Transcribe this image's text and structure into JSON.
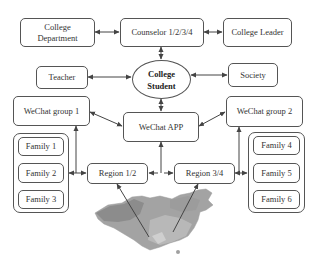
{
  "diagram": {
    "nodes": {
      "college_department": "College Department",
      "counselor": "Counselor 1/2/3/4",
      "college_leader": "College Leader",
      "teacher": "Teacher",
      "college_student": "College Student",
      "society": "Society",
      "wechat_group_1": "WeChat group 1",
      "wechat_app": "WeChat APP",
      "wechat_group_2": "WeChat group 2",
      "region_1_2": "Region 1/2",
      "region_3_4": "Region 3/4"
    },
    "family_left": [
      "Family 1",
      "Family 2",
      "Family 3"
    ],
    "family_right": [
      "Family 4",
      "Family 5",
      "Family 6"
    ],
    "edges": [
      [
        "College Department",
        "Counselor 1/2/3/4",
        "bidirectional"
      ],
      [
        "Counselor 1/2/3/4",
        "College Leader",
        "bidirectional"
      ],
      [
        "Counselor 1/2/3/4",
        "College Student",
        "bidirectional"
      ],
      [
        "Teacher",
        "College Student",
        "bidirectional"
      ],
      [
        "College Student",
        "Society",
        "bidirectional"
      ],
      [
        "College Student",
        "WeChat APP",
        "bidirectional"
      ],
      [
        "WeChat group 1",
        "WeChat APP",
        "bidirectional"
      ],
      [
        "WeChat APP",
        "WeChat group 2",
        "bidirectional"
      ],
      [
        "WeChat APP",
        "Region 1/2 / Region 3/4",
        "bidirectional"
      ],
      [
        "Family 1-3",
        "Region 1/2",
        "bidirectional"
      ],
      [
        "Region 3/4",
        "Family 4-6",
        "bidirectional"
      ],
      [
        "Family 1-3",
        "WeChat group 1",
        "directed"
      ],
      [
        "Family 4-6",
        "WeChat group 2",
        "directed"
      ],
      [
        "Map",
        "Region 1/2",
        "directed"
      ],
      [
        "Map",
        "Region 3/4",
        "directed"
      ]
    ],
    "map_label": "China map"
  },
  "colors": {
    "stroke": "#555555",
    "map_dark": "#8a8a8a",
    "map_light": "#b5b5b5"
  }
}
